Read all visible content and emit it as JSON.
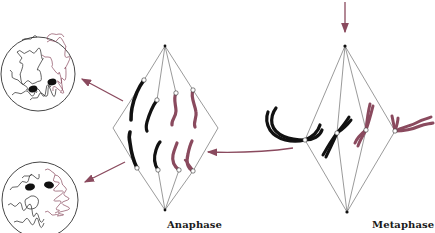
{
  "figure": {
    "type": "cell-division-diagram",
    "labels": {
      "anaphase": "Anaphase",
      "metaphase": "Metaphase"
    },
    "colors": {
      "maternal_chromosome": "#1a1a1a",
      "paternal_chromosome": "#8a4a5e",
      "arrow": "#8a4a5e",
      "spindle_line": "#555555",
      "background": "#ffffff"
    },
    "stages": [
      {
        "name": "Metaphase",
        "chromosome_pairs": 4,
        "description": "Chromosomes aligned at spindle equator"
      },
      {
        "name": "Anaphase",
        "chromosome_pairs": 4,
        "description": "Sister chromatids separate to opposite poles"
      },
      {
        "name": "Daughter nuclei",
        "count": 2,
        "description": "Two interphase-like nuclei with decondensed chromatin"
      }
    ],
    "arrows": [
      {
        "from": "top",
        "to": "metaphase"
      },
      {
        "from": "metaphase",
        "to": "anaphase"
      },
      {
        "from": "anaphase-top",
        "to": "daughter-nucleus-top"
      },
      {
        "from": "anaphase-bottom",
        "to": "daughter-nucleus-bottom"
      }
    ]
  }
}
